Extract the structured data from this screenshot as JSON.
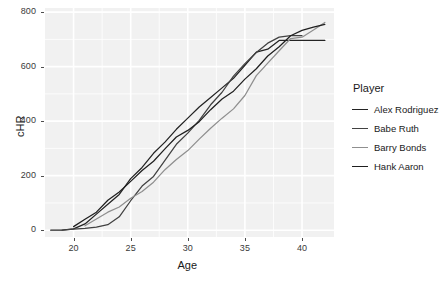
{
  "chart_data": {
    "type": "line",
    "title": "",
    "xlabel": "Age",
    "ylabel": "cHR",
    "xlim": [
      17.5,
      42.8
    ],
    "ylim": [
      -25,
      815
    ],
    "grid": true,
    "legend_position": "right",
    "legend_title": "Player",
    "xticks": [
      20,
      25,
      30,
      35,
      40
    ],
    "xtick_labels": [
      "20",
      "25",
      "30",
      "35",
      "40"
    ],
    "yticks": [
      0,
      200,
      400,
      600,
      800
    ],
    "ytick_labels": [
      "0",
      "200",
      "400",
      "600",
      "800"
    ],
    "x_minor_ticks": [
      22.5,
      27.5,
      32.5,
      37.5
    ],
    "y_minor_ticks": [
      100,
      300,
      500,
      700
    ],
    "panel_background": "#f1f1f1",
    "grid_color": "#ffffff",
    "series": [
      {
        "name": "Alex Rodriguez",
        "color": "#232323",
        "x": [
          18,
          19,
          20,
          21,
          22,
          23,
          24,
          25,
          26,
          27,
          28,
          29,
          30,
          31,
          32,
          33,
          34,
          35,
          36,
          37,
          38,
          39,
          40,
          41,
          42
        ],
        "y": [
          0,
          0,
          5,
          23,
          59,
          95,
          131,
          189,
          230,
          282,
          323,
          370,
          411,
          452,
          487,
          522,
          557,
          605,
          653,
          664,
          696,
          696,
          696,
          696,
          696
        ]
      },
      {
        "name": "Babe Ruth",
        "color": "#414141",
        "x": [
          19,
          20,
          21,
          22,
          23,
          24,
          25,
          26,
          27,
          28,
          29,
          30,
          31,
          32,
          33,
          34,
          35,
          36,
          37,
          38,
          39,
          40
        ],
        "y": [
          0,
          4,
          7,
          11,
          20,
          49,
          108,
          162,
          197,
          256,
          315,
          356,
          403,
          460,
          506,
          565,
          611,
          652,
          686,
          708,
          714,
          714
        ]
      },
      {
        "name": "Barry Bonds",
        "color": "#8f8f8f",
        "x": [
          21,
          22,
          23,
          24,
          25,
          26,
          27,
          28,
          29,
          30,
          31,
          32,
          33,
          34,
          35,
          36,
          37,
          38,
          39,
          40,
          41,
          42
        ],
        "y": [
          16,
          41,
          66,
          85,
          117,
          142,
          176,
          222,
          259,
          292,
          334,
          374,
          411,
          445,
          494,
          567,
          613,
          658,
          703,
          708,
          734,
          762
        ]
      },
      {
        "name": "Hank Aaron",
        "color": "#1f1f1f",
        "x": [
          20,
          21,
          22,
          23,
          24,
          25,
          26,
          27,
          28,
          29,
          30,
          31,
          32,
          33,
          34,
          35,
          36,
          37,
          38,
          39,
          40,
          41,
          42
        ],
        "y": [
          13,
          40,
          66,
          110,
          140,
          179,
          219,
          253,
          298,
          342,
          366,
          398,
          442,
          481,
          510,
          554,
          592,
          639,
          673,
          713,
          733,
          745,
          755
        ]
      }
    ]
  }
}
